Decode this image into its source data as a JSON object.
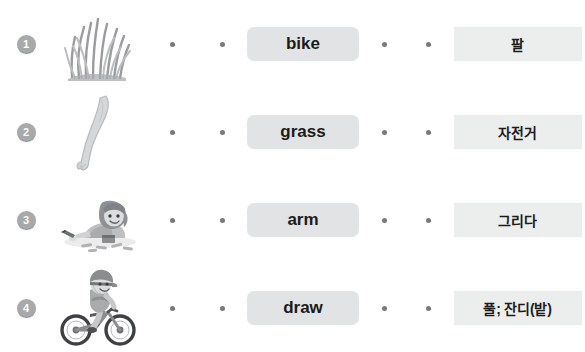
{
  "worksheet": {
    "type": "vocabulary-matching-exercise",
    "colors": {
      "page_background": "#ffffff",
      "badge_fill": "#a7a9ab",
      "badge_text": "#ffffff",
      "english_box_fill": "#e2e3e4",
      "korean_box_fill": "#eceded",
      "dot_fill": "#77797c",
      "word_text": "#1b1b1b"
    },
    "rows": [
      {
        "number": "1",
        "picture_name": "grass-tuft-illustration",
        "picture_label": "grass",
        "left_dot": "connector-dot",
        "english": "bike",
        "middle_dot": "connector-dot",
        "korean": "팔"
      },
      {
        "number": "2",
        "picture_name": "human-arm-illustration",
        "picture_label": "arm",
        "left_dot": "connector-dot",
        "english": "grass",
        "middle_dot": "connector-dot",
        "korean": "자전거"
      },
      {
        "number": "3",
        "picture_name": "child-drawing-with-crayons-illustration",
        "picture_label": "draw",
        "left_dot": "connector-dot",
        "english": "arm",
        "middle_dot": "connector-dot",
        "korean": "그리다"
      },
      {
        "number": "4",
        "picture_name": "child-riding-bicycle-illustration",
        "picture_label": "bike",
        "left_dot": "connector-dot",
        "english": "draw",
        "middle_dot": "connector-dot",
        "korean": "풀; 잔디(밭)"
      }
    ]
  }
}
